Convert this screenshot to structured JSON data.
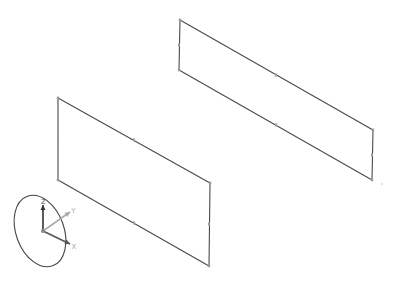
{
  "viewport": {
    "background": "#ffffff",
    "edge_color": "#4a4a4a",
    "vertex_color": "#9a9a9a"
  },
  "sketches": [
    {
      "name": "upper-rectangle",
      "corners": [
        [
          180,
          20
        ],
        [
          373,
          130
        ],
        [
          372,
          180
        ],
        [
          179,
          70
        ]
      ],
      "midpoints": [
        [
          276,
          75
        ],
        [
          372,
          155
        ],
        [
          276,
          125
        ],
        [
          179,
          45
        ]
      ]
    },
    {
      "name": "lower-rectangle",
      "corners": [
        [
          58,
          98
        ],
        [
          210,
          183
        ],
        [
          209,
          266
        ],
        [
          58,
          180
        ]
      ],
      "midpoints": [
        [
          134,
          140
        ],
        [
          209,
          224
        ],
        [
          134,
          223
        ],
        [
          58,
          139
        ]
      ]
    }
  ],
  "triad": {
    "origin": [
      43,
      231
    ],
    "axes": [
      {
        "label": "Z",
        "to": [
          43,
          205
        ],
        "color": "#333333"
      },
      {
        "label": "Y",
        "to": [
          70,
          212
        ],
        "color": "#aaaaaa"
      },
      {
        "label": "X",
        "to": [
          70,
          244
        ],
        "color": "#555555"
      }
    ],
    "ellipse": {
      "cx": 40,
      "cy": 231,
      "rx": 24,
      "ry": 37,
      "rotate": -20,
      "color": "#444444"
    }
  },
  "stray_mark": [
    382,
    184
  ]
}
